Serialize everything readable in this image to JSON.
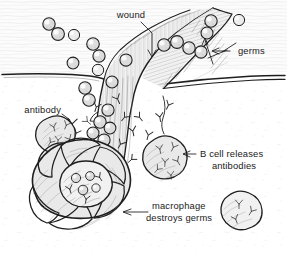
{
  "figure": {
    "type": "scientific-illustration",
    "background_color": "#ffffff",
    "ink_color": "#1f1f1f",
    "label_color": "#1a1a1a"
  },
  "labels": {
    "wound": "wound",
    "germs": "germs",
    "antibody": "antibody",
    "bcell_line1": "B cell releases",
    "bcell_line2": "antibodies",
    "macrophage_line1": "macrophage",
    "macrophage_line2": "destroys germs"
  },
  "structures": {
    "skin_surface": "skin-surface-line",
    "wound_gash": "wound-gash",
    "macrophage": "macrophage-cell",
    "b_cells": [
      "b-cell-left",
      "b-cell-center",
      "b-cell-right"
    ],
    "germ_count_visible": 28,
    "antibody_shape": "Y"
  }
}
